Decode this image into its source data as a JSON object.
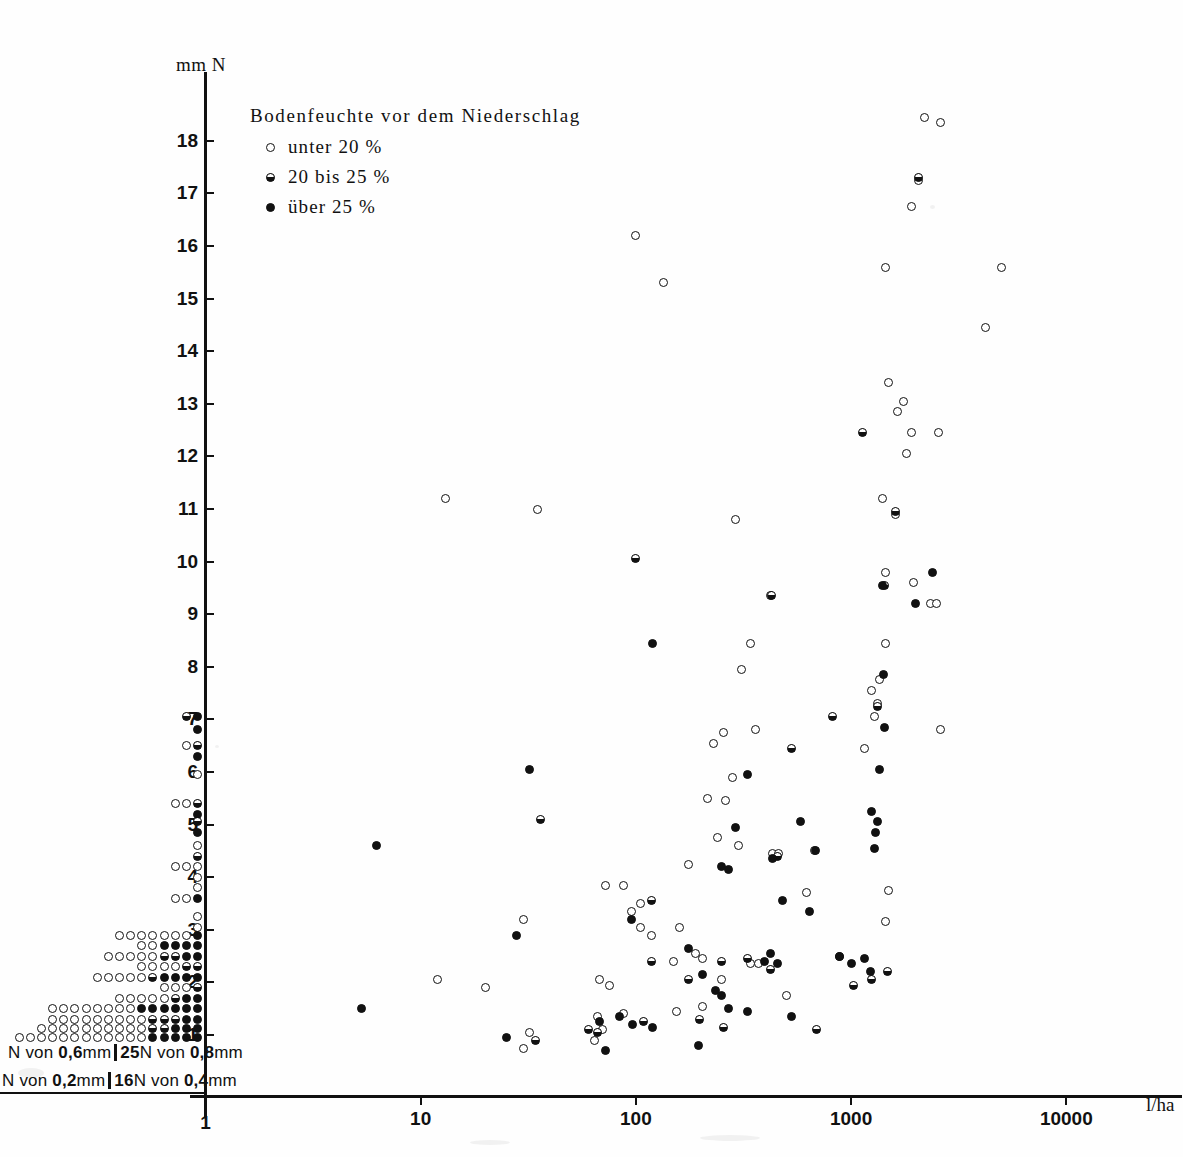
{
  "chart_data": {
    "type": "scatter",
    "title": "",
    "xlabel": "l/ha",
    "ylabel": "mm N",
    "xscale": "log",
    "yscale": "linear",
    "xlim": [
      1,
      10000
    ],
    "ylim": [
      0.6,
      18.6
    ],
    "grid": false,
    "legend_position": "top-left",
    "xticks": [
      "1",
      "10",
      "100",
      "1000",
      "10000"
    ],
    "yticks": [
      "1",
      "2",
      "3",
      "4",
      "5",
      "6",
      "7",
      "8",
      "9",
      "10",
      "11",
      "12",
      "13",
      "14",
      "15",
      "16",
      "17",
      "18"
    ],
    "legend": {
      "title": "Bodenfeuchte  vor  dem  Niederschlag",
      "entries": [
        {
          "marker": "open",
          "label": "unter  20 %"
        },
        {
          "marker": "half",
          "label": "20  bis  25 %"
        },
        {
          "marker": "solid",
          "label": "über  25 %"
        }
      ]
    },
    "annotations": [
      {
        "text_parts": [
          "N  von ",
          "0,6",
          "mm",
          "|",
          "25",
          "N  von ",
          "0,8",
          "mm"
        ],
        "position": "below-axis-left-upper"
      },
      {
        "text_parts": [
          "N  von ",
          "0,2",
          "mm",
          "|",
          "16",
          "N  von ",
          "0,4",
          "mm"
        ],
        "position": "below-axis-left-lower"
      }
    ],
    "series": [
      {
        "name": "unter 20 %",
        "marker": "open",
        "points": [
          [
            2200,
            18.45
          ],
          [
            2600,
            18.35
          ],
          [
            2050,
            17.25
          ],
          [
            1900,
            16.75
          ],
          [
            100,
            16.2
          ],
          [
            135,
            15.3
          ],
          [
            1450,
            15.6
          ],
          [
            5000,
            15.6
          ],
          [
            4200,
            14.45
          ],
          [
            1500,
            13.4
          ],
          [
            1750,
            13.05
          ],
          [
            1650,
            12.85
          ],
          [
            1900,
            12.45
          ],
          [
            2550,
            12.45
          ],
          [
            1800,
            12.05
          ],
          [
            13,
            11.2
          ],
          [
            35,
            11.0
          ],
          [
            290,
            10.8
          ],
          [
            1400,
            11.2
          ],
          [
            1600,
            10.9
          ],
          [
            1450,
            9.8
          ],
          [
            1950,
            9.6
          ],
          [
            2350,
            9.2
          ],
          [
            2500,
            9.2
          ],
          [
            420,
            9.35
          ],
          [
            340,
            8.45
          ],
          [
            1450,
            8.45
          ],
          [
            2600,
            6.8
          ],
          [
            310,
            7.95
          ],
          [
            1350,
            7.75
          ],
          [
            1250,
            7.55
          ],
          [
            1330,
            7.3
          ],
          [
            1280,
            7.05
          ],
          [
            360,
            6.8
          ],
          [
            230,
            6.55
          ],
          [
            1150,
            6.45
          ],
          [
            215,
            5.5
          ],
          [
            240,
            4.75
          ],
          [
            175,
            4.25
          ],
          [
            1500,
            3.75
          ],
          [
            30,
            3.2
          ],
          [
            95,
            3.35
          ],
          [
            105,
            3.05
          ],
          [
            160,
            3.05
          ],
          [
            1450,
            3.15
          ],
          [
            72,
            3.85
          ],
          [
            88,
            3.85
          ],
          [
            105,
            3.5
          ],
          [
            118,
            2.9
          ],
          [
            190,
            2.55
          ],
          [
            205,
            2.45
          ],
          [
            150,
            2.4
          ],
          [
            430,
            4.45
          ],
          [
            68,
            2.05
          ],
          [
            75,
            1.95
          ],
          [
            205,
            1.55
          ],
          [
            12,
            2.05
          ],
          [
            20,
            1.9
          ],
          [
            66,
            1.35
          ],
          [
            70,
            1.1
          ],
          [
            88,
            1.4
          ],
          [
            155,
            1.45
          ],
          [
            32,
            1.05
          ],
          [
            30,
            0.75
          ],
          [
            64,
            0.9
          ],
          [
            500,
            1.75
          ],
          [
            675,
            4.5
          ],
          [
            460,
            4.45
          ],
          [
            260,
            5.45
          ],
          [
            280,
            5.9
          ],
          [
            255,
            6.75
          ],
          [
            300,
            4.6
          ],
          [
            620,
            3.7
          ],
          [
            340,
            2.35
          ],
          [
            370,
            2.35
          ],
          [
            250,
            2.05
          ]
        ]
      },
      {
        "name": "20 bis 25 %",
        "marker": "half",
        "points": [
          [
            100,
            10.05
          ],
          [
            425,
            9.35
          ],
          [
            1130,
            12.45
          ],
          [
            2050,
            17.3
          ],
          [
            1600,
            10.95
          ],
          [
            1430,
            9.55
          ],
          [
            820,
            7.05
          ],
          [
            1330,
            7.25
          ],
          [
            880,
            2.5
          ],
          [
            36,
            5.1
          ],
          [
            118,
            3.55
          ],
          [
            175,
            2.05
          ],
          [
            118,
            2.4
          ],
          [
            250,
            2.4
          ],
          [
            330,
            2.45
          ],
          [
            455,
            4.4
          ],
          [
            420,
            2.25
          ],
          [
            197,
            1.3
          ],
          [
            108,
            1.25
          ],
          [
            60,
            1.1
          ],
          [
            1250,
            2.05
          ],
          [
            1480,
            2.2
          ],
          [
            1030,
            1.95
          ],
          [
            255,
            1.15
          ],
          [
            690,
            1.1
          ],
          [
            66,
            1.05
          ],
          [
            34,
            0.9
          ],
          [
            530,
            6.45
          ]
        ]
      },
      {
        "name": "über 25 %",
        "marker": "solid",
        "points": [
          [
            2400,
            9.8
          ],
          [
            2000,
            9.2
          ],
          [
            1400,
            9.55
          ],
          [
            1350,
            6.05
          ],
          [
            1420,
            7.85
          ],
          [
            1430,
            6.85
          ],
          [
            120,
            8.45
          ],
          [
            330,
            5.95
          ],
          [
            1250,
            5.25
          ],
          [
            1320,
            5.05
          ],
          [
            1300,
            4.85
          ],
          [
            290,
            4.95
          ],
          [
            32,
            6.05
          ],
          [
            6.2,
            4.6
          ],
          [
            250,
            4.2
          ],
          [
            270,
            4.15
          ],
          [
            430,
            4.35
          ],
          [
            680,
            4.5
          ],
          [
            480,
            3.55
          ],
          [
            28,
            2.9
          ],
          [
            95,
            3.2
          ],
          [
            175,
            2.65
          ],
          [
            205,
            2.15
          ],
          [
            235,
            1.85
          ],
          [
            250,
            1.75
          ],
          [
            420,
            2.55
          ],
          [
            455,
            2.35
          ],
          [
            395,
            2.4
          ],
          [
            880,
            2.5
          ],
          [
            1000,
            2.35
          ],
          [
            1150,
            2.45
          ],
          [
            1230,
            2.2
          ],
          [
            530,
            1.35
          ],
          [
            330,
            1.45
          ],
          [
            270,
            1.5
          ],
          [
            195,
            0.8
          ],
          [
            120,
            1.15
          ],
          [
            96,
            1.2
          ],
          [
            68,
            1.25
          ],
          [
            5.3,
            1.5
          ],
          [
            25,
            0.95
          ],
          [
            72,
            0.7
          ],
          [
            84,
            1.35
          ],
          [
            580,
            5.05
          ],
          [
            1290,
            4.55
          ],
          [
            640,
            3.35
          ]
        ]
      }
    ],
    "left_stack": {
      "description": "Stacked marker columns plotted left of the y-axis representing binned counts at each mm N level",
      "rows": [
        {
          "y": 7.05,
          "marks": [
            "half",
            "solid"
          ]
        },
        {
          "y": 6.8,
          "marks": [
            "solid"
          ]
        },
        {
          "y": 6.5,
          "marks": [
            "open",
            "half"
          ]
        },
        {
          "y": 6.3,
          "marks": [
            "solid"
          ]
        },
        {
          "y": 5.95,
          "marks": [
            "open"
          ]
        },
        {
          "y": 5.4,
          "marks": [
            "open",
            "open",
            "half"
          ]
        },
        {
          "y": 5.2,
          "marks": [
            "solid"
          ]
        },
        {
          "y": 5.05,
          "marks": [
            "half"
          ]
        },
        {
          "y": 4.85,
          "marks": [
            "solid"
          ]
        },
        {
          "y": 4.6,
          "marks": [
            "open"
          ]
        },
        {
          "y": 4.4,
          "marks": [
            "half"
          ]
        },
        {
          "y": 4.2,
          "marks": [
            "open",
            "open",
            "open"
          ]
        },
        {
          "y": 4.0,
          "marks": [
            "open"
          ]
        },
        {
          "y": 3.8,
          "marks": [
            "open"
          ]
        },
        {
          "y": 3.6,
          "marks": [
            "open",
            "open",
            "solid"
          ]
        },
        {
          "y": 3.25,
          "marks": [
            "open"
          ]
        },
        {
          "y": 3.05,
          "marks": [
            "open"
          ]
        },
        {
          "y": 2.9,
          "marks": [
            "open",
            "open",
            "open",
            "open",
            "open",
            "open",
            "open",
            "solid"
          ]
        },
        {
          "y": 2.7,
          "marks": [
            "open",
            "open",
            "solid",
            "solid",
            "solid",
            "solid"
          ]
        },
        {
          "y": 2.5,
          "marks": [
            "open",
            "open",
            "open",
            "open",
            "open",
            "half",
            "half",
            "solid",
            "solid"
          ]
        },
        {
          "y": 2.3,
          "marks": [
            "open",
            "open",
            "open",
            "open",
            "half",
            "half"
          ]
        },
        {
          "y": 2.1,
          "marks": [
            "open",
            "open",
            "open",
            "open",
            "open",
            "half",
            "solid",
            "solid",
            "solid",
            "solid"
          ]
        },
        {
          "y": 1.9,
          "marks": [
            "open",
            "open",
            "open",
            "half"
          ]
        },
        {
          "y": 1.7,
          "marks": [
            "open",
            "open",
            "open",
            "open",
            "open",
            "half",
            "solid",
            "solid"
          ]
        },
        {
          "y": 1.5,
          "marks": [
            "open",
            "open",
            "open",
            "open",
            "open",
            "open",
            "open",
            "open",
            "solid",
            "solid",
            "solid",
            "solid",
            "solid",
            "solid"
          ]
        },
        {
          "y": 1.3,
          "marks": [
            "open",
            "open",
            "open",
            "open",
            "open",
            "open",
            "open",
            "open",
            "open",
            "half",
            "half",
            "half",
            "solid",
            "solid"
          ]
        },
        {
          "y": 1.12,
          "marks": [
            "open",
            "open",
            "open",
            "open",
            "open",
            "open",
            "open",
            "open",
            "open",
            "open",
            "half",
            "half",
            "solid",
            "solid",
            "solid"
          ]
        },
        {
          "y": 0.95,
          "marks": [
            "open",
            "open",
            "open",
            "open",
            "open",
            "open",
            "open",
            "open",
            "open",
            "open",
            "open",
            "open",
            "solid",
            "solid",
            "solid",
            "solid",
            "solid"
          ]
        }
      ]
    }
  }
}
